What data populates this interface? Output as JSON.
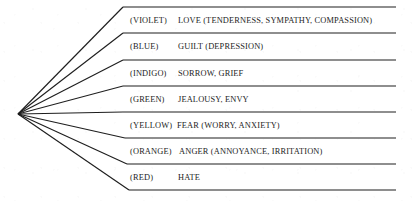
{
  "diagram": {
    "type": "fan-branch-list",
    "title": "",
    "apex": {
      "x": 18,
      "y": 114
    },
    "line_color": "#1e1e1e",
    "background_color": "#ffffff",
    "text_color": "#1d1d1d",
    "rows": [
      {
        "color_label": "(VIOLET)",
        "emotion": "LOVE (TENDERNESS, SYMPATHY, COMPASSION)",
        "line_y": 7,
        "text_y": 14,
        "branch_join_x": 123,
        "emotion_x": 178
      },
      {
        "color_label": "(BLUE)",
        "emotion": "GUILT (DEPRESSION)",
        "line_y": 33,
        "text_y": 40,
        "branch_join_x": 123,
        "emotion_x": 178
      },
      {
        "color_label": "(INDIGO)",
        "emotion": "SORROW, GRIEF",
        "line_y": 60,
        "text_y": 67,
        "branch_join_x": 123,
        "emotion_x": 178
      },
      {
        "color_label": "(GREEN)",
        "emotion": "JEALOUSY, ENVY",
        "line_y": 86,
        "text_y": 93,
        "branch_join_x": 123,
        "emotion_x": 178
      },
      {
        "color_label": "(YELLOW)",
        "emotion": "FEAR (WORRY, ANXIETY)",
        "line_y": 112,
        "text_y": 119,
        "branch_join_x": 123,
        "emotion_x": 177
      },
      {
        "color_label": "(ORANGE)",
        "emotion": "ANGER (ANNOYANCE, IRRITATION)",
        "line_y": 138,
        "text_y": 145,
        "branch_join_x": 125,
        "emotion_x": 179
      },
      {
        "color_label": "(RED)",
        "emotion": "HATE",
        "line_y": 164,
        "text_y": 171,
        "branch_join_x": 127,
        "emotion_x": 178
      }
    ],
    "closing_line_y": 190,
    "closing_branch_join_x": 129,
    "line_right_x": 396
  }
}
